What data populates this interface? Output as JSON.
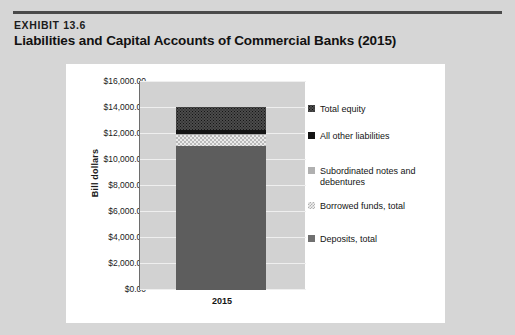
{
  "exhibit": {
    "label": "EXHIBIT 13.6",
    "title": "Liabilities and Capital Accounts of Commercial Banks (2015)"
  },
  "chart_data": {
    "type": "bar",
    "subtype": "stacked-bar",
    "title": "Liabilities and Capital Accounts of Commercial Banks (2015)",
    "xlabel": "",
    "ylabel": "Bill dollars",
    "categories": [
      "2015"
    ],
    "ylim": [
      0,
      16000
    ],
    "ytick_values": [
      0,
      2000,
      4000,
      6000,
      8000,
      10000,
      12000,
      14000,
      16000
    ],
    "ytick_labels": [
      "$16,000.00",
      "$14,000.00",
      "$12,000.00",
      "$10,000.00",
      "$8,000.00",
      "$6,000.00",
      "$4,000.00",
      "$2,000.00",
      "$0.00"
    ],
    "grid": true,
    "legend_position": "right",
    "series": [
      {
        "name": "Total equity",
        "key": "equity",
        "values": [
          1750
        ],
        "swatch": "dark-dotted",
        "color": "#4c4c4c"
      },
      {
        "name": "All other liabilities",
        "key": "other",
        "values": [
          300
        ],
        "swatch": "solid-black",
        "color": "#141414"
      },
      {
        "name": "Subordinated notes and debentures",
        "key": "subordinated",
        "values": [
          70
        ],
        "swatch": "solid-light-grey",
        "color": "#a9a9a9"
      },
      {
        "name": "Borrowed funds, total",
        "key": "borrowed",
        "values": [
          880
        ],
        "swatch": "light-checker",
        "color": "#eaeaea"
      },
      {
        "name": "Deposits, total",
        "key": "deposits",
        "values": [
          11000
        ],
        "swatch": "solid-grey",
        "color": "#5d5d5d"
      }
    ],
    "stack_order_bottom_to_top": [
      "deposits",
      "borrowed",
      "subordinated",
      "other",
      "equity"
    ]
  },
  "legend": {
    "items": [
      {
        "label": "Total equity"
      },
      {
        "label": "All other liabilities"
      },
      {
        "label": "Subordinated notes and debentures"
      },
      {
        "label": "Borrowed funds, total"
      },
      {
        "label": "Deposits, total"
      }
    ]
  },
  "axis": {
    "x_category": "2015",
    "y_title": "Bill dollars"
  }
}
